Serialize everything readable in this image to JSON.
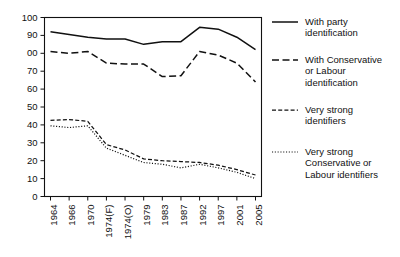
{
  "chart_data": {
    "type": "line",
    "title": "",
    "xlabel": "",
    "ylabel": "",
    "ylim": [
      0,
      100
    ],
    "ytick_values": [
      0,
      10,
      20,
      30,
      40,
      50,
      60,
      70,
      80,
      90,
      100
    ],
    "ytick_labels": [
      "0",
      "10",
      "20",
      "30",
      "40",
      "50",
      "60",
      "70",
      "00",
      "90",
      "100"
    ],
    "grid": false,
    "legend_position": "right",
    "categories": [
      "1964",
      "1966",
      "1970",
      "1974(F)",
      "1974(O)",
      "1979",
      "1983",
      "1987",
      "1992",
      "1997",
      "2001",
      "2005"
    ],
    "series": [
      {
        "name": "With party identification",
        "style": "solid",
        "values": [
          92,
          90.5,
          89,
          88,
          88,
          85,
          86.5,
          86.5,
          94.5,
          93.5,
          89,
          82
        ]
      },
      {
        "name": "With Conservative or Labour identification",
        "style": "dashed",
        "values": [
          81,
          80,
          81,
          74.5,
          74,
          74,
          67,
          67.5,
          81,
          79,
          74.5,
          64
        ]
      },
      {
        "name": "Very strong identifiers",
        "style": "short-dashed",
        "values": [
          42.5,
          43,
          42,
          29,
          26,
          21,
          20,
          19.5,
          19,
          17.5,
          15,
          12
        ]
      },
      {
        "name": "Very strong Conservative or Labour identifiers",
        "style": "dotted",
        "values": [
          39.5,
          38.5,
          39.5,
          27,
          23,
          19,
          18,
          16,
          18,
          16,
          13.5,
          10
        ]
      }
    ]
  },
  "legend": {
    "entries": [
      {
        "label_line1": "With party",
        "label_line2": "identification",
        "label_line3": "",
        "style": "solid"
      },
      {
        "label_line1": "With Conservative",
        "label_line2": "or Labour",
        "label_line3": "identification",
        "style": "dashed"
      },
      {
        "label_line1": "Very strong",
        "label_line2": "identifiers",
        "label_line3": "",
        "style": "short-dashed"
      },
      {
        "label_line1": "Very strong",
        "label_line2": "Conservative or",
        "label_line3": "Labour identifiers",
        "style": "dotted"
      }
    ]
  },
  "colors": {
    "ink": "#111111",
    "background": "#ffffff"
  }
}
